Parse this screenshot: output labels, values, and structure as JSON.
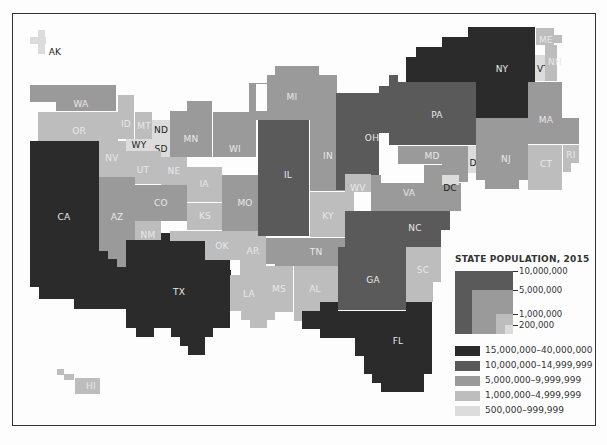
{
  "title": "STATE POPULATION, 2015",
  "colors": {
    "class1": "#2b2b2b",
    "class2": "#5a5a5a",
    "class3": "#9a9a9a",
    "class4": "#bdbdbd",
    "class5": "#dcdcdc"
  },
  "legend": {
    "title": "STATE POPULATION, 2015",
    "size_ticks": [
      "10,000,000",
      "5,000,000",
      "1,000,000",
      "200,000"
    ],
    "classes": [
      {
        "label": "15,000,000–40,000,000",
        "color": "#2b2b2b"
      },
      {
        "label": "10,000,000–14,999,999",
        "color": "#5a5a5a"
      },
      {
        "label": "5,000,000–9,999,999",
        "color": "#9a9a9a"
      },
      {
        "label": "1,000,000–4,999,999",
        "color": "#bdbdbd"
      },
      {
        "label": "500,000–999,999",
        "color": "#dcdcdc"
      }
    ]
  },
  "states": {
    "AK": "AK",
    "HI": "HI",
    "WA": "WA",
    "OR": "OR",
    "CA": "CA",
    "ID": "ID",
    "MT": "MT",
    "ND": "ND",
    "SD": "SD",
    "WY": "WY",
    "NV": "NV",
    "UT": "UT",
    "NE": "NE",
    "CO": "CO",
    "AZ": "AZ",
    "NM": "NM",
    "KS": "KS",
    "OK": "OK",
    "TX": "TX",
    "MN": "MN",
    "IA": "IA",
    "MO": "MO",
    "AR": "AR",
    "LA": "LA",
    "WI": "WI",
    "IL": "IL",
    "MI": "MI",
    "IN": "IN",
    "OH": "OH",
    "KY": "KY",
    "TN": "TN",
    "MS": "MS",
    "AL": "AL",
    "GA": "GA",
    "FL": "FL",
    "SC": "SC",
    "NC": "NC",
    "VA": "VA",
    "WV": "WV",
    "MD": "MD",
    "DC": "DC",
    "DE": "DE",
    "PA": "PA",
    "NJ": "NJ",
    "NY": "NY",
    "CT": "CT",
    "RI": "RI",
    "MA": "MA",
    "VT": "VT",
    "NH": "NH",
    "ME": "ME"
  }
}
